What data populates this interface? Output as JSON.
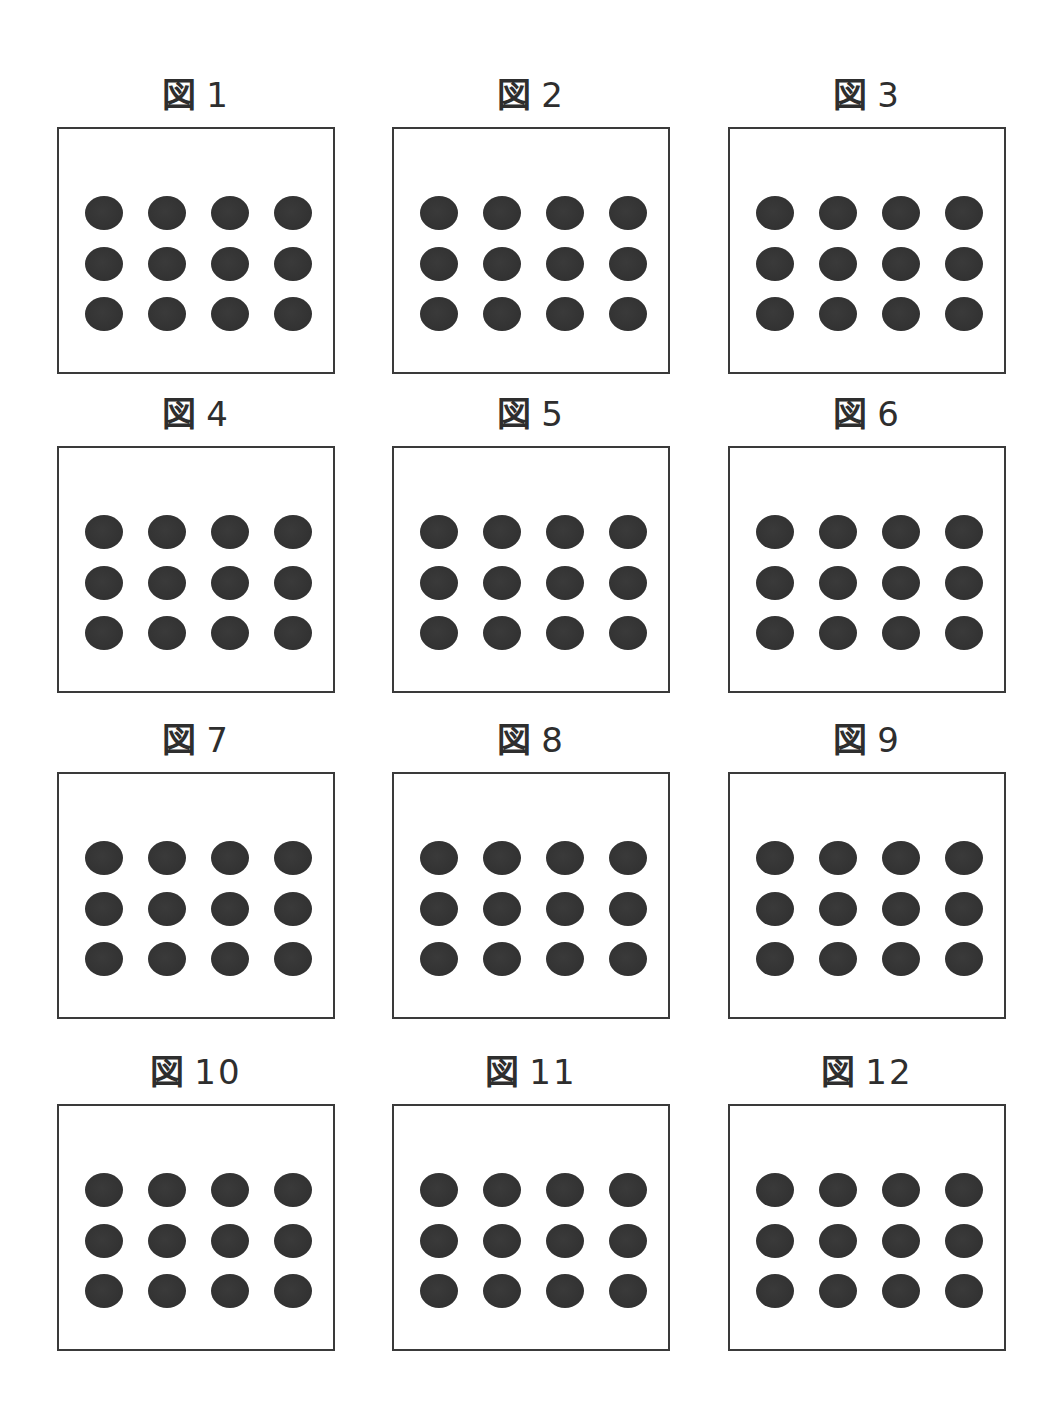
{
  "figures": [
    {
      "label": "図",
      "number": "1",
      "dot_rows": 3,
      "dot_cols": 4
    },
    {
      "label": "図",
      "number": "2",
      "dot_rows": 3,
      "dot_cols": 4
    },
    {
      "label": "図",
      "number": "3",
      "dot_rows": 3,
      "dot_cols": 4
    },
    {
      "label": "図",
      "number": "4",
      "dot_rows": 3,
      "dot_cols": 4
    },
    {
      "label": "図",
      "number": "5",
      "dot_rows": 3,
      "dot_cols": 4
    },
    {
      "label": "図",
      "number": "6",
      "dot_rows": 3,
      "dot_cols": 4
    },
    {
      "label": "図",
      "number": "7",
      "dot_rows": 3,
      "dot_cols": 4
    },
    {
      "label": "図",
      "number": "8",
      "dot_rows": 3,
      "dot_cols": 4
    },
    {
      "label": "図",
      "number": "9",
      "dot_rows": 3,
      "dot_cols": 4
    },
    {
      "label": "図",
      "number": "10",
      "dot_rows": 3,
      "dot_cols": 4
    },
    {
      "label": "図",
      "number": "11",
      "dot_rows": 3,
      "dot_cols": 4
    },
    {
      "label": "図",
      "number": "12",
      "dot_rows": 3,
      "dot_cols": 4
    }
  ],
  "colors": {
    "dot": "#333333",
    "border": "#3a3a3a",
    "text": "#2e2e2e",
    "background": "#ffffff"
  }
}
